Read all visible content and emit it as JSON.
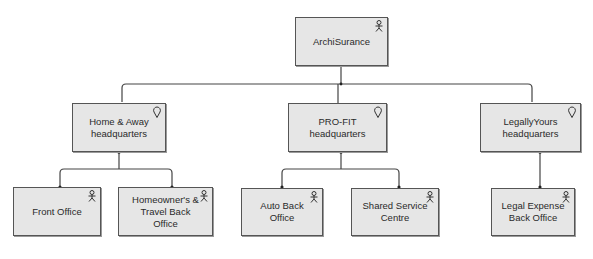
{
  "diagram": {
    "type": "organization-structure",
    "colors": {
      "node_fill": "#e6e6e6",
      "node_border": "#555555",
      "line": "#444444",
      "text": "#2a2a2a"
    },
    "root": {
      "label": "ArchiSurance",
      "icon": "actor-icon"
    },
    "locations": [
      {
        "label": "Home & Away headquarters",
        "icon": "location-icon"
      },
      {
        "label": "PRO-FIT headquarters",
        "icon": "location-icon"
      },
      {
        "label": "LegallyYours headquarters",
        "icon": "location-icon"
      }
    ],
    "units": [
      {
        "label": "Front Office",
        "icon": "actor-icon",
        "parent": "Home & Away headquarters"
      },
      {
        "label": "Homeowner's & Travel Back Office",
        "icon": "actor-icon",
        "parent": "Home & Away headquarters"
      },
      {
        "label": "Auto Back Office",
        "icon": "actor-icon",
        "parent": "PRO-FIT headquarters"
      },
      {
        "label": "Shared Service Centre",
        "icon": "actor-icon",
        "parent": "PRO-FIT headquarters"
      },
      {
        "label": "Legal Expense Back Office",
        "icon": "actor-icon",
        "parent": "LegallyYours headquarters"
      }
    ]
  }
}
